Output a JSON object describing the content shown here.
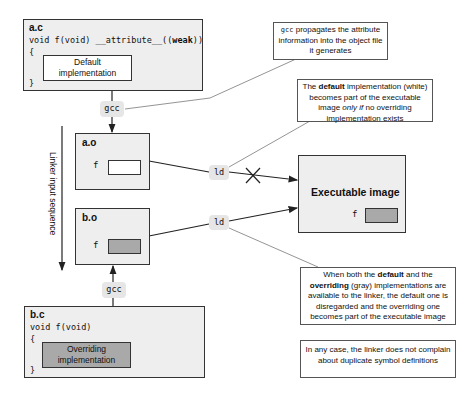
{
  "source_a": {
    "filename": "a.c",
    "signature_prefix": "void f(void) __attribute__((",
    "signature_attr": "weak",
    "signature_suffix": "))",
    "open_brace": "{",
    "close_brace": "}",
    "impl_line1": "Default",
    "impl_line2": "implementation"
  },
  "source_b": {
    "filename": "b.c",
    "signature": "void f(void)",
    "open_brace": "{",
    "close_brace": "}",
    "impl_line1": "Overriding",
    "impl_line2": "implementation"
  },
  "tools": {
    "gcc_top": "gcc",
    "gcc_bottom": "gcc",
    "ld_top": "ld",
    "ld_bottom": "ld"
  },
  "objects": {
    "a_o": {
      "filename": "a.o",
      "symbol": "f",
      "slot_color": "#ffffff"
    },
    "b_o": {
      "filename": "b.o",
      "symbol": "f",
      "slot_color": "#a9a9a9"
    }
  },
  "executable": {
    "title": "Executable image",
    "symbol": "f",
    "slot_color": "#a9a9a9"
  },
  "linker_sequence_label": "Linker input sequence",
  "callouts": {
    "gcc_propagates": {
      "mono": "gcc",
      "text": " propagates the attribute information into the object file it generates"
    },
    "default_impl": {
      "t1": "The ",
      "b1": "default",
      "t2": " implementation (white) becomes part of the executable image ",
      "i1": "only if",
      "t3": " no overriding implementation exists"
    },
    "both_available": {
      "t1": "When both the ",
      "b1": "default",
      "t2": " and the ",
      "b2": "overriding",
      "t3": " (gray) implementations  are available to the linker, the default one is disregarded and the overriding one becomes part of the executable image"
    },
    "no_complaint": {
      "text": "In any case, the linker does not complain about duplicate symbol definitions"
    }
  },
  "colors": {
    "box_fill": "#eeeeee",
    "overriding_fill": "#a9a9a9",
    "tool_label_fill": "#e6e6e6",
    "stroke": "#333333"
  }
}
